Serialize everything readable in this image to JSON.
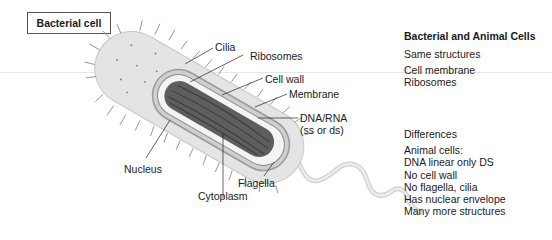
{
  "title": "Bacterial cell",
  "diagram": {
    "labels": {
      "cilia": "Cilia",
      "ribosomes": "Ribosomes",
      "cell_wall": "Cell wall",
      "membrane": "Membrane",
      "dna_rna": "DNA/RNA",
      "dna_rna_note": "(ss or ds)",
      "nucleus": "Nucleus",
      "flagella": "Flagella",
      "cytoplasm": "Cytoplasm"
    }
  },
  "panel": {
    "heading": "Bacterial and Animal Cells",
    "same_heading": "Same structures",
    "same_items": [
      "Cell membrane",
      "Ribosomes"
    ],
    "diff_heading": "Differences",
    "diff_subheading": "Animal cells:",
    "diff_items": [
      "DNA linear only DS",
      "No cell wall",
      "No flagella, cilia",
      "Has nuclear envelope",
      "Many more structures"
    ]
  }
}
